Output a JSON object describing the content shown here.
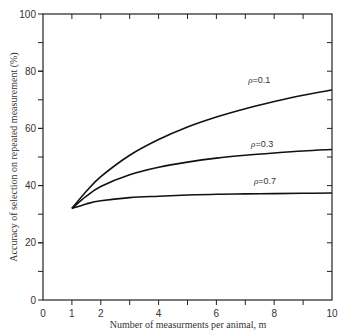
{
  "chart_data": {
    "type": "line",
    "title": "",
    "xlabel": "Number of measurments per animal, m",
    "ylabel": "Accuracy of selection on repeated measurement (%)",
    "xlim": [
      0,
      10
    ],
    "ylim": [
      0,
      100
    ],
    "x_ticks": [
      0,
      1,
      2,
      4,
      6,
      8,
      10
    ],
    "x_minor_ticks": [
      3,
      5,
      7,
      9
    ],
    "y_ticks": [
      0,
      20,
      40,
      60,
      80,
      100
    ],
    "y_minor_ticks": [
      10,
      30,
      50,
      70,
      90
    ],
    "grid": false,
    "legend_position": "inline labels above curves",
    "x": [
      1,
      1.5,
      2,
      3,
      4,
      5,
      6,
      7,
      8,
      9,
      10
    ],
    "series": [
      {
        "name": "ρ=0.1",
        "rho": "ρ",
        "value_label": "=0.1",
        "values": [
          32,
          38.0,
          43.1,
          50.6,
          56.1,
          60.5,
          64.0,
          66.9,
          69.4,
          71.6,
          73.4
        ],
        "label_at": [
          7.1,
          76
        ]
      },
      {
        "name": "ρ=0.3",
        "rho": "ρ",
        "value_label": "=0.3",
        "values": [
          32,
          36.3,
          39.7,
          43.8,
          46.4,
          48.2,
          49.6,
          50.6,
          51.4,
          52.1,
          52.6
        ],
        "label_at": [
          7.2,
          53.5
        ]
      },
      {
        "name": "ρ=0.7",
        "rho": "ρ",
        "value_label": "=0.7",
        "values": [
          32,
          33.6,
          34.7,
          35.8,
          36.3,
          36.7,
          37.0,
          37.1,
          37.2,
          37.3,
          37.4
        ],
        "label_at": [
          7.3,
          40.5
        ]
      }
    ]
  }
}
